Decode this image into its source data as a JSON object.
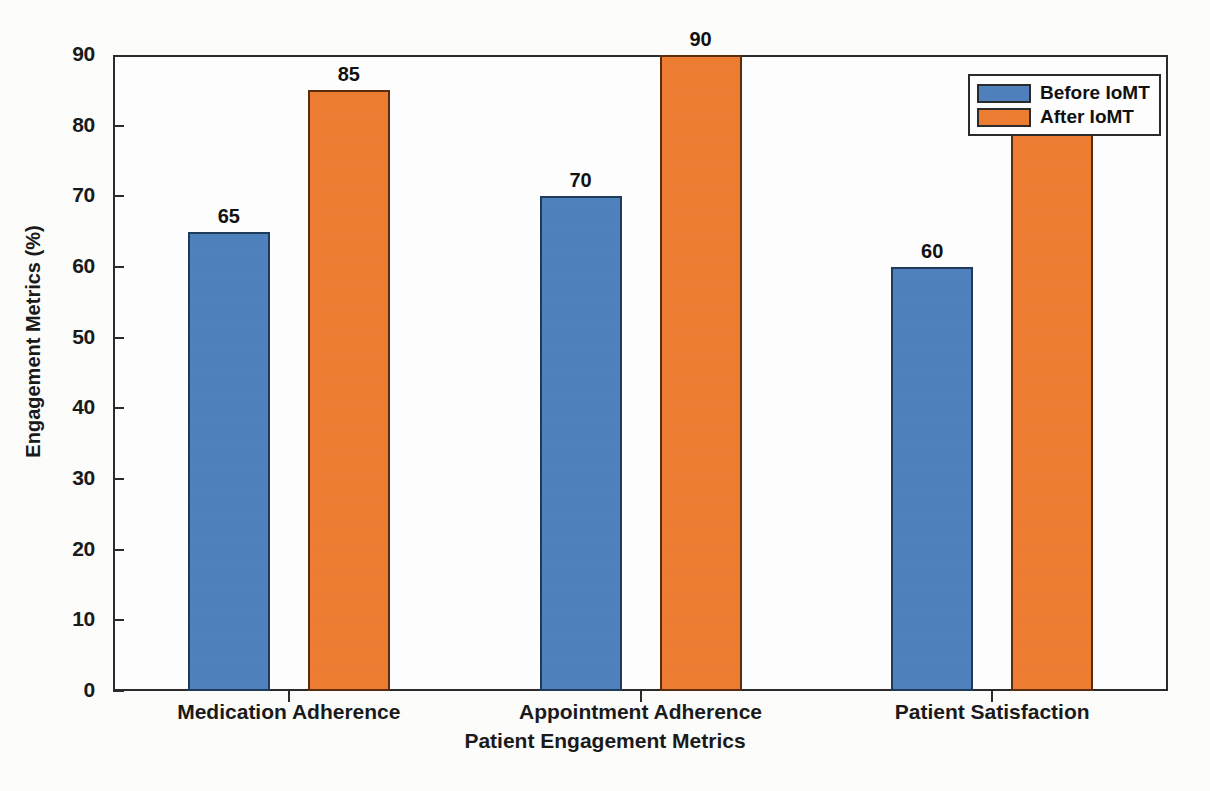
{
  "chart_data": {
    "type": "bar",
    "title": "",
    "xlabel": "Patient Engagement Metrics",
    "ylabel": "Engagement Metrics (%)",
    "categories": [
      "Medication Adherence",
      "Appointment Adherence",
      "Patient Satisfaction"
    ],
    "series": [
      {
        "name": "Before IoMT",
        "color": "#4f81bd",
        "values": [
          65,
          70,
          60
        ]
      },
      {
        "name": "After IoMT",
        "color": "#ed7d31",
        "values": [
          85,
          90,
          79
        ]
      }
    ],
    "value_labels": {
      "before": [
        "65",
        "70",
        "60"
      ],
      "after": [
        "85",
        "90",
        ""
      ]
    },
    "ylim": [
      0,
      90
    ],
    "ytick_labels": [
      "0",
      "10",
      "20",
      "30",
      "40",
      "50",
      "60",
      "70",
      "80",
      "90"
    ],
    "ytick_values": [
      0,
      10,
      20,
      30,
      40,
      50,
      60,
      70,
      80,
      90
    ],
    "grid": false,
    "legend_position": "top-right"
  },
  "legend": {
    "entries": [
      {
        "label": "Before IoMT",
        "color": "#4f81bd"
      },
      {
        "label": "After IoMT",
        "color": "#ed7d31"
      }
    ]
  },
  "axis": {
    "x_title": "Patient Engagement Metrics",
    "y_title": "Engagement Metrics (%)"
  }
}
